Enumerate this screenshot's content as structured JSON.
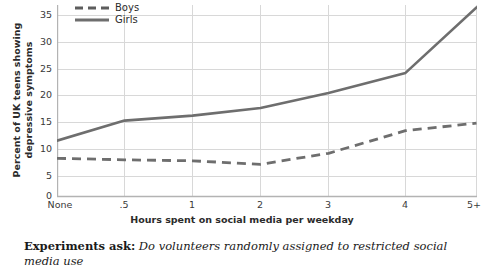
{
  "chart_data": {
    "type": "line",
    "title": "",
    "xlabel": "Hours spent on social media per weekday",
    "ylabel": "Percent of UK teens showing depressive symptoms",
    "categories": [
      "None",
      ".5",
      "1",
      "2",
      "3",
      "4",
      "5+"
    ],
    "ylim": [
      0,
      38
    ],
    "yticks": [
      0,
      5,
      10,
      15,
      20,
      25,
      30,
      35
    ],
    "grid": true,
    "legend_position": "top-left",
    "series": [
      {
        "name": "Boys",
        "style": "dashed",
        "color": "#6e6e6e",
        "values": [
          7.5,
          7.2,
          7.0,
          6.3,
          8.5,
          13.0,
          14.5
        ]
      },
      {
        "name": "Girls",
        "style": "solid",
        "color": "#6e6e6e",
        "values": [
          11.0,
          15.0,
          16.0,
          17.5,
          20.5,
          24.5,
          37.5
        ]
      }
    ]
  },
  "axis": {
    "y_title_line1": "Percent of UK teens showing",
    "y_title_line2": "depressive symptoms",
    "x_title": "Hours spent on social media per weekday",
    "y_ticks": [
      "35",
      "30",
      "25",
      "20",
      "15",
      "10",
      "5",
      "0"
    ],
    "x_ticks": [
      "None",
      ".5",
      "1",
      "2",
      "3",
      "4",
      "5+"
    ]
  },
  "legend": {
    "items": [
      {
        "label": "Boys",
        "style": "dashed"
      },
      {
        "label": "Girls",
        "style": "solid"
      }
    ]
  },
  "caption": {
    "lead": "Experiments ask:",
    "body": "Do volunteers randomly assigned to restricted social media use"
  },
  "colors": {
    "line": "#6e6e6e",
    "grid": "#d6d6d6",
    "axis": "#b3b3b3",
    "text": "#333333"
  }
}
